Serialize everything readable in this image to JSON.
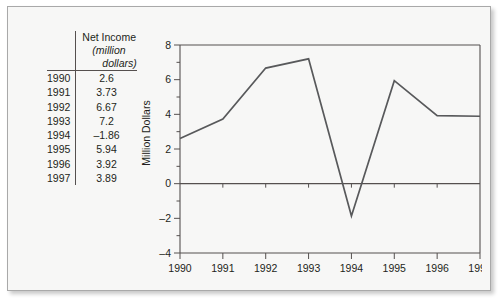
{
  "figure": {
    "background_color": "#f7f7f6",
    "border_color": "#a9a9a9",
    "ink_color": "#231f20",
    "line_color": "#58595b"
  },
  "table": {
    "header": {
      "line1": "Net Income",
      "line2": "(million",
      "line3": "dollars)"
    },
    "rows": [
      {
        "year": "1990",
        "value": "2.6"
      },
      {
        "year": "1991",
        "value": "3.73"
      },
      {
        "year": "1992",
        "value": "6.67"
      },
      {
        "year": "1993",
        "value": "7.2"
      },
      {
        "year": "1994",
        "value": "–1.86"
      },
      {
        "year": "1995",
        "value": "5.94"
      },
      {
        "year": "1996",
        "value": "3.92"
      },
      {
        "year": "1997",
        "value": "3.89"
      }
    ]
  },
  "chart_data": {
    "type": "line",
    "title": "",
    "xlabel": "",
    "ylabel": "Million Dollars",
    "categories": [
      "1990",
      "1991",
      "1992",
      "1993",
      "1994",
      "1995",
      "1996",
      "1997"
    ],
    "values": [
      2.6,
      3.73,
      6.67,
      7.2,
      -1.86,
      5.94,
      3.92,
      3.89
    ],
    "series": [
      {
        "name": "Net Income",
        "values": [
          2.6,
          3.73,
          6.67,
          7.2,
          -1.86,
          5.94,
          3.92,
          3.89
        ]
      }
    ],
    "ylim": [
      -4,
      8
    ],
    "xlim": [
      "1990",
      "1997"
    ],
    "y_major_ticks": [
      8,
      6,
      4,
      2,
      0,
      -2,
      -4
    ],
    "y_major_tick_labels": [
      "8",
      "6",
      "4",
      "2",
      "0",
      "–2",
      "–4"
    ],
    "y_minor_ticks": [
      7,
      5,
      3,
      1,
      -1,
      -3
    ],
    "x_tick_labels": [
      "1990",
      "1991",
      "1992",
      "1993",
      "1994",
      "1995",
      "1996",
      "1997"
    ],
    "grid": false,
    "legend": false,
    "zero_line": true,
    "units": "million dollars"
  }
}
